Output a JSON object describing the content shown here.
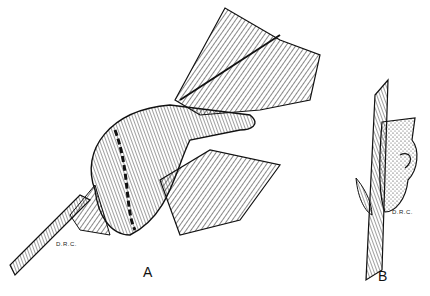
{
  "figure": {
    "panels": [
      {
        "id": "A",
        "label": "A",
        "subject": "leaf-fold gall on leaf with stem",
        "signature": "D.R.C."
      },
      {
        "id": "B",
        "label": "B",
        "subject": "pouch gall on twig",
        "signature": "D.R.C."
      }
    ],
    "colors": {
      "ink": "#111111",
      "paper": "#ffffff"
    }
  }
}
